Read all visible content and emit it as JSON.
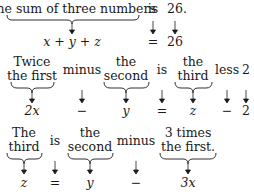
{
  "rows": [
    {
      "phrases": [
        {
          "lines": [
            "The sum of three numbers"
          ],
          "braced": true,
          "math": "x + y + z"
        },
        {
          "lines": [
            "is"
          ],
          "braced": false,
          "math": "="
        },
        {
          "lines": [
            "26."
          ],
          "braced": false,
          "math": "26"
        }
      ]
    },
    {
      "phrases": [
        {
          "lines": [
            "Twice",
            "the first"
          ],
          "braced": true,
          "math": "2x"
        },
        {
          "lines": [
            "minus"
          ],
          "braced": false,
          "math": "−"
        },
        {
          "lines": [
            "the",
            "second"
          ],
          "braced": true,
          "math": "y"
        },
        {
          "lines": [
            "is"
          ],
          "braced": false,
          "math": "="
        },
        {
          "lines": [
            "the",
            "third"
          ],
          "braced": true,
          "math": "z"
        },
        {
          "lines": [
            "less"
          ],
          "braced": false,
          "math": "−"
        },
        {
          "lines": [
            "2"
          ],
          "braced": false,
          "math": "2"
        }
      ]
    },
    {
      "phrases": [
        {
          "lines": [
            "The",
            "third"
          ],
          "braced": true,
          "math": "z"
        },
        {
          "lines": [
            "is"
          ],
          "braced": false,
          "math": "="
        },
        {
          "lines": [
            "the",
            "second"
          ],
          "braced": true,
          "math": "y"
        },
        {
          "lines": [
            "minus"
          ],
          "braced": false,
          "math": "−"
        },
        {
          "lines": [
            "3 times",
            "the first."
          ],
          "braced": true,
          "math": "3x"
        }
      ]
    }
  ]
}
